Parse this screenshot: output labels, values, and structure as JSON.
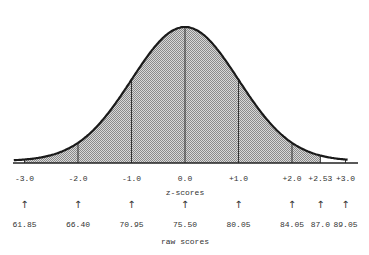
{
  "chart_data": {
    "type": "area",
    "title": "",
    "xlabel": "z-scores",
    "xlabel2": "raw scores",
    "ylabel": "",
    "z_ticks": [
      "-3.0",
      "-2.0",
      "-1.0",
      "0.0",
      "+1.0",
      "+2.0",
      "+2.53",
      "+3.0"
    ],
    "z_values": [
      -3.0,
      -2.0,
      -1.0,
      0.0,
      1.0,
      2.0,
      2.53,
      3.0
    ],
    "raw_ticks": [
      "61.85",
      "66.40",
      "70.95",
      "75.50",
      "80.05",
      "84.05",
      "87.0",
      "89.05"
    ],
    "shaded_range": [
      -3.0,
      2.53
    ],
    "grid": false,
    "legend": null
  },
  "labels": {
    "z_axis": "z-scores",
    "raw_axis": "raw scores"
  },
  "colors": {
    "curve": "#1a1a1a",
    "shade": "#b0b0b0",
    "text": "#333333"
  }
}
